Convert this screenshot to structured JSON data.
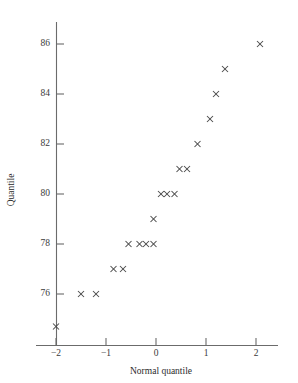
{
  "chart_data": {
    "type": "scatter",
    "title": "",
    "xlabel": "Normal quantile",
    "ylabel": "Quantile",
    "xlim": [
      -2.4,
      2.4
    ],
    "ylim": [
      74.6,
      87.0
    ],
    "xticks": [
      -2,
      -1,
      0,
      1,
      2
    ],
    "xticklabels": [
      "−2",
      "−1",
      "0",
      "1",
      "2"
    ],
    "yticks": [
      76,
      78,
      80,
      82,
      84,
      86
    ],
    "yticklabels": [
      "76",
      "78",
      "80",
      "82",
      "84",
      "86"
    ],
    "grid": false,
    "legend": null,
    "marker": "x",
    "marker_color": "#4a4a4a",
    "axis_color": "#6b6b6b",
    "n_points": 20,
    "x": [
      -2.0,
      -1.5,
      -1.2,
      -0.85,
      -0.66,
      -0.55,
      -0.33,
      -0.2,
      -0.05,
      0.1,
      0.22,
      0.37,
      0.15,
      0.47,
      0.62,
      0.83,
      1.08,
      1.2,
      1.38,
      2.08
    ],
    "y": [
      74.7,
      76.0,
      76.0,
      77.0,
      77.0,
      78.0,
      78.0,
      78.0,
      78.0,
      79.0,
      80.0,
      80.0,
      80.0,
      81.0,
      81.0,
      82.0,
      83.0,
      84.0,
      85.0,
      86.0
    ],
    "points": [
      {
        "x": -2.0,
        "y": 74.7
      },
      {
        "x": -1.5,
        "y": 76.0
      },
      {
        "x": -1.2,
        "y": 76.0
      },
      {
        "x": -0.85,
        "y": 77.0
      },
      {
        "x": -0.66,
        "y": 77.0
      },
      {
        "x": -0.55,
        "y": 78.0
      },
      {
        "x": -0.33,
        "y": 78.0
      },
      {
        "x": -0.2,
        "y": 78.0
      },
      {
        "x": -0.05,
        "y": 78.0
      },
      {
        "x": -0.05,
        "y": 79.0
      },
      {
        "x": 0.1,
        "y": 80.0
      },
      {
        "x": 0.22,
        "y": 80.0
      },
      {
        "x": 0.37,
        "y": 80.0
      },
      {
        "x": 0.47,
        "y": 81.0
      },
      {
        "x": 0.62,
        "y": 81.0
      },
      {
        "x": 0.83,
        "y": 82.0
      },
      {
        "x": 1.08,
        "y": 83.0
      },
      {
        "x": 1.2,
        "y": 84.0
      },
      {
        "x": 1.38,
        "y": 85.0
      },
      {
        "x": 2.08,
        "y": 86.0
      }
    ]
  },
  "axes": {
    "x_title": "Normal quantile",
    "y_title": "Quantile"
  }
}
